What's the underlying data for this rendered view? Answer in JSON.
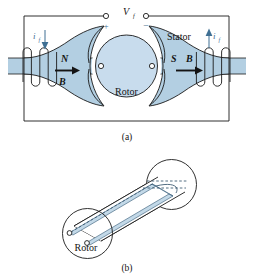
{
  "figure": {
    "caption_a": "(a)",
    "caption_b": "(b)",
    "panel_a": {
      "voltage_source_label": "V",
      "voltage_source_sub": "f",
      "terminal_plus": "+",
      "terminal_minus": "−",
      "current_left_label": "i",
      "current_left_sub": "f",
      "current_right_label": "i",
      "current_right_sub": "f",
      "stator_label": "Stator",
      "rotor_label": "Rotor",
      "north_pole_label": "N",
      "south_pole_label": "S",
      "flux_left_label": "B",
      "flux_right_label": "B"
    },
    "panel_b": {
      "rotor_label": "Rotor"
    }
  },
  "colors": {
    "stator_fill": "#b3cfe2",
    "rotor_fill": "#c8dced",
    "winding_fill": "#c3d9e8",
    "outline": "#1a1a1a",
    "accent_blue": "#3f6f93",
    "background": "#ffffff"
  }
}
